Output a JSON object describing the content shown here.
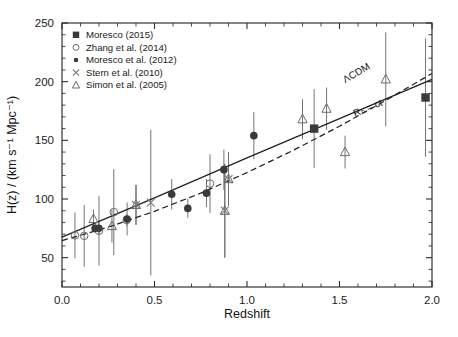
{
  "figure": {
    "background": "#ffffff",
    "frame_color": "#2b2b2b"
  },
  "chart_data": {
    "type": "scatter",
    "title": "",
    "xlabel": "Redshift",
    "ylabel": "H(z) / (km s⁻¹ Mpc⁻¹)",
    "xlim": [
      0.0,
      2.0
    ],
    "ylim": [
      25,
      250
    ],
    "xticks": [
      0.0,
      0.5,
      1.0,
      1.5,
      2.0
    ],
    "xticklabels": [
      "0.0",
      "0.5",
      "1.0",
      "1.5",
      "2.0"
    ],
    "yticks": [
      50,
      100,
      150,
      200,
      250
    ],
    "yticklabels": [
      "50",
      "100",
      "150",
      "200",
      "250"
    ],
    "x_minor_step": 0.1,
    "y_minor_step": 10,
    "grid": false,
    "legend_position": "upper-left",
    "series": [
      {
        "name": "Moresco (2015)",
        "marker": "filled-square",
        "color": "#3a3a3a",
        "points": [
          {
            "x": 1.363,
            "y": 160.0,
            "yerr": 33.6
          },
          {
            "x": 1.965,
            "y": 186.5,
            "yerr": 50.4
          }
        ]
      },
      {
        "name": "Zhang et al. (2014)",
        "marker": "open-circle",
        "color": "#6b6b6b",
        "points": [
          {
            "x": 0.07,
            "y": 69.0,
            "yerr": 19.6
          },
          {
            "x": 0.12,
            "y": 68.6,
            "yerr": 26.2
          },
          {
            "x": 0.2,
            "y": 72.9,
            "yerr": 29.6
          },
          {
            "x": 0.28,
            "y": 88.8,
            "yerr": 36.6
          },
          {
            "x": 0.35,
            "y": 82.1,
            "yerr": 4.85
          },
          {
            "x": 0.8,
            "y": 113.1,
            "yerr": 25.0
          }
        ]
      },
      {
        "name": "Moresco et al. (2012)",
        "marker": "filled-circle",
        "color": "#3a3a3a",
        "points": [
          {
            "x": 0.179,
            "y": 75.0,
            "yerr": 4.0
          },
          {
            "x": 0.199,
            "y": 75.0,
            "yerr": 5.0
          },
          {
            "x": 0.352,
            "y": 83.0,
            "yerr": 14.0
          },
          {
            "x": 0.593,
            "y": 104.0,
            "yerr": 13.0
          },
          {
            "x": 0.68,
            "y": 92.0,
            "yerr": 8.0
          },
          {
            "x": 0.781,
            "y": 105.0,
            "yerr": 12.0
          },
          {
            "x": 0.875,
            "y": 125.0,
            "yerr": 17.0
          },
          {
            "x": 1.037,
            "y": 154.0,
            "yerr": 20.0
          }
        ]
      },
      {
        "name": "Stern et al. (2010)",
        "marker": "cross-x",
        "color": "#7d7d7d",
        "points": [
          {
            "x": 0.48,
            "y": 97.0,
            "yerr": 62.0
          },
          {
            "x": 0.88,
            "y": 90.0,
            "yerr": 40.0
          },
          {
            "x": 0.4,
            "y": 95.0,
            "yerr": 17.0
          },
          {
            "x": 0.9,
            "y": 117.0,
            "yerr": 23.0
          }
        ]
      },
      {
        "name": "Simon et al. (2005)",
        "marker": "open-triangle",
        "color": "#6b6b6b",
        "points": [
          {
            "x": 0.17,
            "y": 83.0,
            "yerr": 8.0
          },
          {
            "x": 0.27,
            "y": 77.0,
            "yerr": 14.0
          },
          {
            "x": 0.4,
            "y": 95.0,
            "yerr": 17.0
          },
          {
            "x": 0.88,
            "y": 90.0,
            "yerr": 40.0
          },
          {
            "x": 0.9,
            "y": 117.0,
            "yerr": 23.0
          },
          {
            "x": 1.3,
            "y": 168.0,
            "yerr": 17.0
          },
          {
            "x": 1.43,
            "y": 177.0,
            "yerr": 18.0
          },
          {
            "x": 1.53,
            "y": 140.0,
            "yerr": 14.0
          },
          {
            "x": 1.75,
            "y": 202.0,
            "yerr": 40.0
          }
        ]
      }
    ],
    "models": [
      {
        "name": "ΛCDM",
        "style": "dashed",
        "color": "#222222",
        "label_x": 1.6,
        "label_y": 205,
        "curve": [
          {
            "x": 0.0,
            "y": 64.5
          },
          {
            "x": 0.25,
            "y": 76.0
          },
          {
            "x": 0.5,
            "y": 89.5
          },
          {
            "x": 0.75,
            "y": 105.0
          },
          {
            "x": 1.0,
            "y": 122.5
          },
          {
            "x": 1.25,
            "y": 141.5
          },
          {
            "x": 1.5,
            "y": 162.0
          },
          {
            "x": 1.75,
            "y": 184.0
          },
          {
            "x": 2.0,
            "y": 207.0
          }
        ]
      },
      {
        "name": "Rₕ = ct",
        "style": "solid",
        "color": "#222222",
        "label_x": 1.66,
        "label_y": 175,
        "curve": [
          {
            "x": 0.0,
            "y": 67.5
          },
          {
            "x": 0.5,
            "y": 101.0
          },
          {
            "x": 1.0,
            "y": 135.0
          },
          {
            "x": 1.5,
            "y": 168.5
          },
          {
            "x": 2.0,
            "y": 202.0
          }
        ]
      }
    ]
  },
  "legend": {
    "entries": [
      {
        "label": "Moresco (2015)",
        "marker": "filled-square"
      },
      {
        "label": "Zhang et al. (2014)",
        "marker": "open-circle"
      },
      {
        "label": "Moresco et al. (2012)",
        "marker": "filled-circle"
      },
      {
        "label": "Stern et al. (2010)",
        "marker": "cross-x"
      },
      {
        "label": "Simon et al. (2005)",
        "marker": "open-triangle"
      }
    ]
  }
}
